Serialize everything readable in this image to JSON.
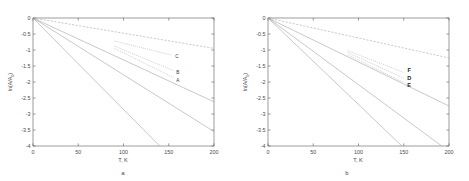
{
  "figure": {
    "title": "",
    "panels": [
      "a",
      "b"
    ]
  },
  "chart_data": [
    {
      "type": "line",
      "panel_label": "a",
      "title": "",
      "xlabel": "T, K",
      "ylabel": "ln(A/A0)",
      "ylabel_display": "ln(A/A",
      "ylabel_sub": "0",
      "ylabel_tail": ")",
      "xlim": [
        0,
        200
      ],
      "ylim": [
        -4,
        0
      ],
      "xticks": [
        0,
        50,
        100,
        150,
        200
      ],
      "xticklabels": [
        "0",
        "50",
        "100",
        "150",
        "200"
      ],
      "yticks": [
        0,
        -0.5,
        -1,
        -1.5,
        -2,
        -2.5,
        -3,
        -3.5,
        -4
      ],
      "yticklabels": [
        "0",
        "-0.5",
        "-1",
        "-1.5",
        "-2",
        "-2.5",
        "-3",
        "-3.5",
        "-4"
      ],
      "grid": false,
      "legend": "inline-labels",
      "series": [
        {
          "name": "line-1-steepest",
          "style": "solid",
          "x": [
            0,
            140
          ],
          "y": [
            0,
            -4.0
          ]
        },
        {
          "name": "line-2",
          "style": "solid",
          "x": [
            0,
            200
          ],
          "y": [
            0,
            -3.55
          ]
        },
        {
          "name": "line-3",
          "style": "solid",
          "x": [
            0,
            200
          ],
          "y": [
            0,
            -2.62
          ]
        },
        {
          "name": "line-A",
          "label": "A",
          "style": "dotted",
          "x": [
            90,
            155
          ],
          "y": [
            -0.95,
            -1.86
          ],
          "label_x": 160,
          "label_y": -1.93
        },
        {
          "name": "line-B",
          "label": "B",
          "style": "dotted",
          "x": [
            90,
            155
          ],
          "y": [
            -0.88,
            -1.64
          ],
          "label_x": 160,
          "label_y": -1.68
        },
        {
          "name": "line-C",
          "label": "C",
          "style": "dotted",
          "x": [
            90,
            152
          ],
          "y": [
            -0.72,
            -1.15
          ],
          "label_x": 159,
          "label_y": -1.18
        },
        {
          "name": "line-shallowest",
          "style": "dashed",
          "x": [
            0,
            200
          ],
          "y": [
            0,
            -0.95
          ]
        }
      ]
    },
    {
      "type": "line",
      "panel_label": "b",
      "title": "",
      "xlabel": "T, K",
      "ylabel": "ln(A/A0)",
      "ylabel_display": "ln(A/A",
      "ylabel_sub": "0",
      "ylabel_tail": ")",
      "xlim": [
        0,
        200
      ],
      "ylim": [
        -4,
        0
      ],
      "xticks": [
        0,
        50,
        100,
        150,
        200
      ],
      "xticklabels": [
        "0",
        "50",
        "100",
        "150",
        "200"
      ],
      "yticks": [
        0,
        -0.5,
        -1,
        -1.5,
        -2,
        -2.5,
        -3,
        -3.5,
        -4
      ],
      "yticklabels": [
        "0",
        "-0.5",
        "-1",
        "-1.5",
        "-2",
        "-2.5",
        "-3",
        "-3.5",
        "-4"
      ],
      "grid": false,
      "legend": "inline-labels",
      "series": [
        {
          "name": "line-1-steepest",
          "style": "solid",
          "x": [
            0,
            148
          ],
          "y": [
            0,
            -4.0
          ]
        },
        {
          "name": "line-2",
          "style": "solid",
          "x": [
            0,
            192
          ],
          "y": [
            0,
            -4.0
          ]
        },
        {
          "name": "line-3",
          "style": "solid",
          "x": [
            0,
            200
          ],
          "y": [
            0,
            -2.75
          ]
        },
        {
          "name": "line-E",
          "label": "E",
          "style": "dotted",
          "x": [
            88,
            150
          ],
          "y": [
            -1.15,
            -2.02
          ],
          "label_x": 156,
          "label_y": -2.1
        },
        {
          "name": "line-D",
          "label": "D",
          "style": "dotted",
          "x": [
            88,
            150
          ],
          "y": [
            -1.08,
            -1.88
          ],
          "label_x": 156,
          "label_y": -1.88
        },
        {
          "name": "line-F",
          "label": "F",
          "style": "dotted",
          "x": [
            88,
            150
          ],
          "y": [
            -1.02,
            -1.7
          ],
          "label_x": 156,
          "label_y": -1.62
        },
        {
          "name": "line-shallowest",
          "style": "dashed",
          "x": [
            0,
            200
          ],
          "y": [
            0,
            -1.25
          ]
        }
      ]
    }
  ]
}
